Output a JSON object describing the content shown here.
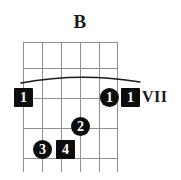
{
  "chord": {
    "name": "B",
    "position_label": "VII",
    "instrument": "guitar",
    "string_count": 6,
    "fret_count": 5,
    "barre": {
      "present": true,
      "finger": "1",
      "from_string": 1,
      "to_string": 6
    },
    "markers": [
      {
        "finger": "1",
        "shape": "square",
        "string": 1,
        "fret": 1
      },
      {
        "finger": "1",
        "shape": "circle",
        "string": 5,
        "fret": 1
      },
      {
        "finger": "1",
        "shape": "square",
        "string": 6,
        "fret": 1
      },
      {
        "finger": "2",
        "shape": "circle",
        "string": 4,
        "fret": 2
      },
      {
        "finger": "3",
        "shape": "circle",
        "string": 2,
        "fret": 3
      },
      {
        "finger": "4",
        "shape": "square",
        "string": 3,
        "fret": 3
      }
    ],
    "colors": {
      "grid": "#8f8f8f",
      "marker_fill": "#0d0d0d",
      "marker_text": "#ffffff",
      "text": "#1a1a1a",
      "background": "#ffffff"
    }
  }
}
